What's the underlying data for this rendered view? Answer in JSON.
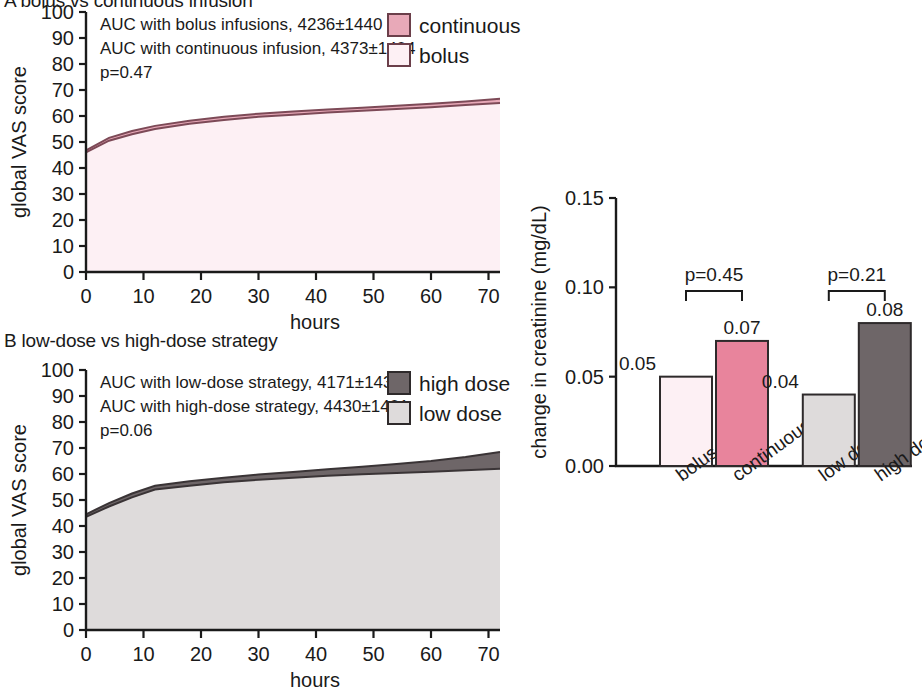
{
  "figure": {
    "panelA": {
      "id": "A",
      "title": "A  bolus vs continuous infusion",
      "notes": [
        "AUC with bolus infusions, 4236±1440",
        "AUC with continuous infusion, 4373±1404",
        "p=0.47"
      ],
      "legend": [
        {
          "label": "continuous",
          "color": "#e8a9b8",
          "border": "#6b3f4a"
        },
        {
          "label": "bolus",
          "color": "#fdf0f4",
          "border": "#6b3f4a"
        }
      ]
    },
    "panelB": {
      "id": "B",
      "title": "B  low-dose vs high-dose strategy",
      "notes": [
        "AUC with low-dose strategy, 4171±1436",
        "AUC with high-dose strategy, 4430±1401",
        "p=0.06"
      ],
      "legend": [
        {
          "label": "high dose",
          "color": "#6e6668",
          "border": "#2e2a2b"
        },
        {
          "label": "low dose",
          "color": "#dedbdb",
          "border": "#2e2a2b"
        }
      ]
    },
    "panelC": {
      "id": "C",
      "brackets": [
        {
          "label": "p=0.45"
        },
        {
          "label": "p=0.21"
        }
      ]
    }
  },
  "chart_data": [
    {
      "type": "area",
      "panel": "A",
      "title": "A  bolus vs continuous infusion",
      "xlabel": "hours",
      "ylabel": "global VAS score",
      "xlim": [
        0,
        72
      ],
      "ylim": [
        0,
        100
      ],
      "xticks": [
        0,
        10,
        20,
        30,
        40,
        50,
        60,
        70
      ],
      "yticks": [
        0,
        10,
        20,
        30,
        40,
        50,
        60,
        70,
        80,
        90,
        100
      ],
      "grid": false,
      "legend_position": "top-right",
      "x": [
        0,
        4,
        8,
        12,
        18,
        24,
        30,
        36,
        42,
        48,
        54,
        60,
        66,
        72
      ],
      "series": [
        {
          "name": "bolus",
          "color": "#fdf0f4",
          "values": [
            46.0,
            50.5,
            53.0,
            55.0,
            57.0,
            58.5,
            59.7,
            60.5,
            61.3,
            62.0,
            62.7,
            63.4,
            64.2,
            65.0
          ]
        },
        {
          "name": "continuous",
          "color": "#e8a9b8",
          "values": [
            46.8,
            51.6,
            54.2,
            56.2,
            58.2,
            59.7,
            60.9,
            61.7,
            62.5,
            63.2,
            63.9,
            64.7,
            65.6,
            66.6
          ]
        }
      ],
      "annotations": [
        "AUC with bolus infusions, 4236±1440",
        "AUC with continuous infusion, 4373±1404",
        "p=0.47"
      ]
    },
    {
      "type": "area",
      "panel": "B",
      "title": "B  low-dose vs high-dose strategy",
      "xlabel": "hours",
      "ylabel": "global VAS score",
      "xlim": [
        0,
        72
      ],
      "ylim": [
        0,
        100
      ],
      "xticks": [
        0,
        10,
        20,
        30,
        40,
        50,
        60,
        70
      ],
      "yticks": [
        0,
        10,
        20,
        30,
        40,
        50,
        60,
        70,
        80,
        90,
        100
      ],
      "grid": false,
      "legend_position": "top-right",
      "x": [
        0,
        4,
        8,
        12,
        18,
        24,
        30,
        36,
        42,
        48,
        54,
        60,
        66,
        72
      ],
      "series": [
        {
          "name": "low dose",
          "color": "#dedbdb",
          "values": [
            43.5,
            47.5,
            51.0,
            54.0,
            55.5,
            56.8,
            57.8,
            58.6,
            59.3,
            59.9,
            60.4,
            60.9,
            61.4,
            62.0
          ]
        },
        {
          "name": "high dose",
          "color": "#6e6668",
          "values": [
            44.5,
            48.8,
            52.5,
            55.5,
            57.2,
            58.6,
            59.8,
            60.8,
            61.8,
            62.8,
            63.8,
            65.0,
            66.5,
            68.5
          ]
        }
      ],
      "annotations": [
        "AUC with low-dose strategy, 4171±1436",
        "AUC with high-dose strategy, 4430±1401",
        "p=0.06"
      ]
    },
    {
      "type": "bar",
      "panel": "C",
      "title": "",
      "xlabel": "",
      "ylabel": "change in creatinine (mg/dL)",
      "ylim": [
        0.0,
        0.15
      ],
      "yticks": [
        0.0,
        0.05,
        0.1,
        0.15
      ],
      "ytick_labels": [
        "0.00",
        "0.05",
        "0.10",
        "0.15"
      ],
      "grid": false,
      "categories": [
        "bolus",
        "continuous",
        "low dose",
        "high dose"
      ],
      "values": [
        0.05,
        0.07,
        0.04,
        0.08
      ],
      "value_labels": [
        "0.05",
        "0.07",
        "0.04",
        "0.08"
      ],
      "colors": [
        "#fdf0f4",
        "#e8849c",
        "#dedbdb",
        "#6e6668"
      ],
      "groups": [
        {
          "name": "bolus vs continuous",
          "bars": [
            0,
            1
          ],
          "p": "p=0.45"
        },
        {
          "name": "low vs high dose",
          "bars": [
            2,
            3
          ],
          "p": "p=0.21"
        }
      ]
    }
  ]
}
